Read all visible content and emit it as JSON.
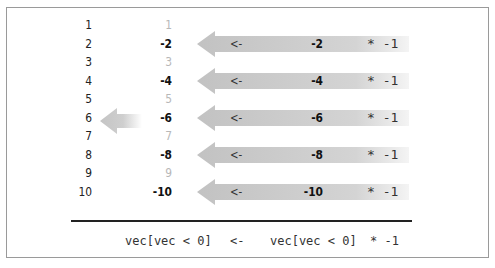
{
  "diagram": {
    "indices": [
      "1",
      "2",
      "3",
      "4",
      "5",
      "6",
      "7",
      "8",
      "9",
      "10"
    ],
    "values": [
      "1",
      "-2",
      "3",
      "-4",
      "5",
      "-6",
      "7",
      "-8",
      "9",
      "-10"
    ],
    "negative_rows": [
      {
        "index": 2,
        "assign_op": "<-",
        "source_value": "-2",
        "multiplier": "* -1"
      },
      {
        "index": 4,
        "assign_op": "<-",
        "source_value": "-4",
        "multiplier": "* -1"
      },
      {
        "index": 6,
        "assign_op": "<-",
        "source_value": "-6",
        "multiplier": "* -1"
      },
      {
        "index": 8,
        "assign_op": "<-",
        "source_value": "-8",
        "multiplier": "* -1"
      },
      {
        "index": 10,
        "assign_op": "<-",
        "source_value": "-10",
        "multiplier": "* -1"
      }
    ],
    "code": {
      "lhs": "vec[vec < 0]",
      "op": "<-",
      "rhs": "vec[vec < 0]",
      "mult": "* -1"
    },
    "colors": {
      "arrow_dark": "#c4c4c4",
      "arrow_light": "#ffffff",
      "dim_text": "#b8b8b8",
      "text": "#111111",
      "frame_border": "#9a9a9a"
    }
  }
}
